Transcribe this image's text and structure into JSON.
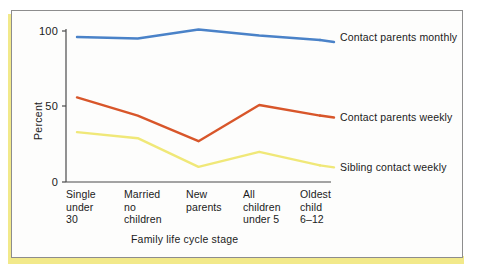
{
  "chart_data": {
    "type": "line",
    "title": "",
    "xlabel": "Family life cycle stage",
    "ylabel": "Percent",
    "categories": [
      "Single\nunder\n30",
      "Married\nno\nchildren",
      "New\nparents",
      "All\nchildren\nunder 5",
      "Oldest\nchild\n6–12"
    ],
    "yticks": [
      "0",
      "50",
      "100"
    ],
    "ylim": [
      0,
      100
    ],
    "grid": false,
    "legend_position": "right-inline",
    "series": [
      {
        "name": "Contact parents monthly",
        "color": "#4a82c8",
        "values": [
          96,
          95,
          101,
          97,
          94
        ]
      },
      {
        "name": "Contact parents weekly",
        "color": "#d8562a",
        "values": [
          56,
          44,
          27,
          51,
          44
        ]
      },
      {
        "name": "Sibling contact weekly",
        "color": "#f0e878",
        "values": [
          33,
          29,
          10,
          20,
          11
        ]
      }
    ]
  },
  "axis": {
    "y_title": "Percent",
    "x_title": "Family life cycle stage",
    "tick_100": "100",
    "tick_50": "50",
    "tick_0": "0"
  },
  "colors": {
    "page_accent": "#f2e98a",
    "card_background": "#fdfdfc",
    "card_border": "#8d8d8d",
    "axis_line": "#4a4a4a",
    "text": "#1b1b1b"
  }
}
